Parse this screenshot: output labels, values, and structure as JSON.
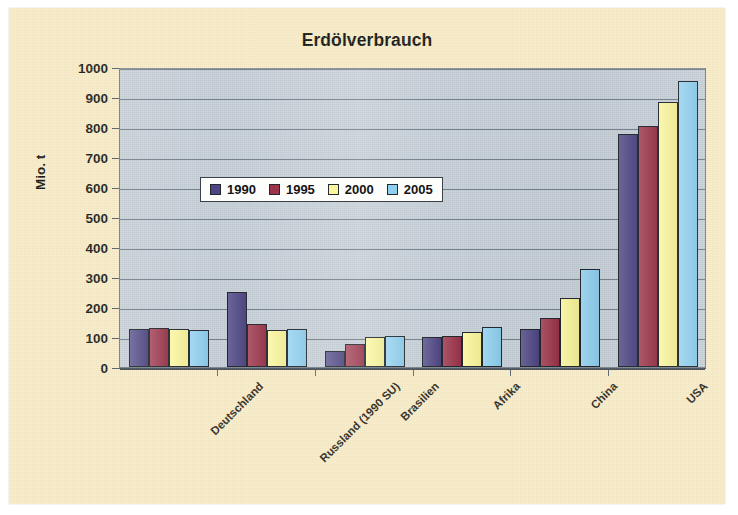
{
  "chart_data": {
    "type": "bar",
    "title": "Erdölverbrauch",
    "xlabel": "",
    "ylabel": "Mio. t",
    "ylim": [
      0,
      1000
    ],
    "ytick_step": 100,
    "yticks": [
      0,
      100,
      200,
      300,
      400,
      500,
      600,
      700,
      800,
      900,
      1000
    ],
    "ytick_labels": [
      "0",
      "100",
      "200",
      "300",
      "400",
      "500",
      "600",
      "700",
      "800",
      "900",
      "1000"
    ],
    "grid": true,
    "legend_position": "upper center inside",
    "categories": [
      "Deutschland",
      "Russland (1990 SU)",
      "Brasilien",
      "Afrika",
      "China",
      "USA"
    ],
    "series": [
      {
        "name": "1990",
        "color": "#4e4684",
        "values": [
          126,
          250,
          55,
          100,
          128,
          778
        ]
      },
      {
        "name": "1995",
        "color": "#9b3349",
        "values": [
          130,
          143,
          76,
          103,
          165,
          805
        ]
      },
      {
        "name": "2000",
        "color": "#fbf69b",
        "values": [
          127,
          124,
          100,
          118,
          230,
          882
        ]
      },
      {
        "name": "2005",
        "color": "#8fd0f0",
        "values": [
          124,
          126,
          103,
          133,
          328,
          955
        ]
      }
    ]
  },
  "colors": {
    "page_background": "#f7ebc6",
    "plot_background": "#c2cbd3",
    "axis": "#4e575f",
    "gridline": "#76808a",
    "text": "#141414"
  }
}
